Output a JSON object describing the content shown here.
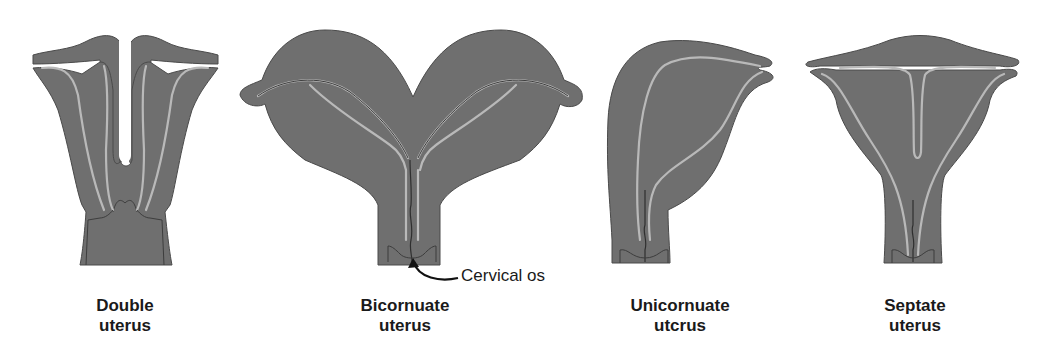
{
  "figure": {
    "panels": [
      {
        "id": "double",
        "title_line1": "Double",
        "title_line2": "uterus"
      },
      {
        "id": "bicornuate",
        "title_line1": "Bicornuate",
        "title_line2": "uterus"
      },
      {
        "id": "unicornuate",
        "title_line1": "Unicornuate",
        "title_line2": "utcrus"
      },
      {
        "id": "septate",
        "title_line1": "Septate",
        "title_line2": "uterus"
      }
    ],
    "annotation": {
      "label": "Cervical os",
      "target": "bicornuate"
    },
    "colors": {
      "tissue": "#6f6f6f",
      "cavity_line": "#b9b9b9",
      "background": "#ffffff",
      "text": "#1a1a1a"
    }
  }
}
